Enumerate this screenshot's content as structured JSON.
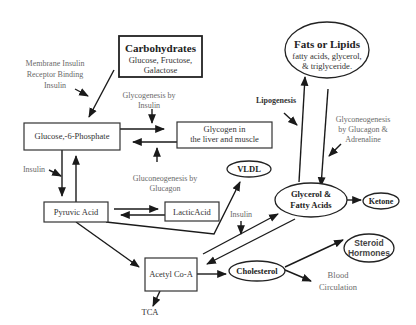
{
  "diagram": {
    "nodes": {
      "carbohydrates": {
        "title": "Carbohydrates",
        "line1": "Glucose, Fructose,",
        "line2": "Galactose"
      },
      "fats": {
        "title": "Fats or Lipids",
        "line1": "fatty acids, glycerol,",
        "line2": "& triglyceride."
      },
      "glucose6p": {
        "label": "Glucose,-6-Phosphate"
      },
      "glycogen": {
        "line1": "Glycogen in",
        "line2": "the liver and muscle"
      },
      "pyruvic": {
        "label": "Pyruvic Acid"
      },
      "lactic": {
        "label": "LacticAcid"
      },
      "vldl": {
        "label": "VLDL"
      },
      "glycerol": {
        "line1": "Glycerol &",
        "line2": "Fatty Acids"
      },
      "ketone": {
        "label": "Ketone"
      },
      "acetyl": {
        "label": "Acetyl Co-A"
      },
      "cholesterol": {
        "label": "Cholesterol"
      },
      "steroid": {
        "line1": "Steroid",
        "line2": "Hormones"
      },
      "tca": {
        "label": "TCA"
      },
      "blood": {
        "line1": "Blood",
        "line2": "Circulation"
      }
    },
    "labels": {
      "membrane": {
        "line1": "Membrane Insulin",
        "line2": "Receptor Binding",
        "line3": "Insulin"
      },
      "glycogenesis": {
        "line1": "Glycogenesis by",
        "line2": "Insulin"
      },
      "gluconeogenesis": {
        "line1": "Gluconeogenesis by",
        "line2": "Glucagon"
      },
      "insulin_left": "Insulin",
      "insulin_mid": "Insulin",
      "lipogenesis": "Lipogenesis",
      "glyconeogenesis": {
        "line1": "Glyconeogenesis",
        "line2": "by Glucagon &",
        "line3": "Adrenaline"
      }
    }
  }
}
